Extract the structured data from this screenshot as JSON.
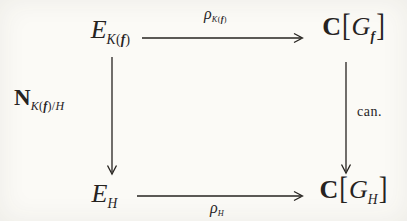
{
  "colors": {
    "ink": "#26231f",
    "paper": "#fbfaf6"
  },
  "diagram": {
    "nodes": {
      "tl": {
        "base": "E",
        "sub_k": "K",
        "sub_lp": "(",
        "sub_f": "f",
        "sub_rp": ")"
      },
      "tr": {
        "c": "C",
        "lb": "[",
        "g": "G",
        "sub_f": "f",
        "rb": "]"
      },
      "bl": {
        "base": "E",
        "sub_h": "H"
      },
      "br": {
        "c": "C",
        "lb": "[",
        "g": "G",
        "sub_h": "H",
        "rb": "]"
      }
    },
    "arrows": {
      "top": {
        "rho": "ρ",
        "sub_k": "K",
        "sub_lp": "(",
        "sub_f": "f",
        "sub_rp": ")"
      },
      "left": {
        "n": "N",
        "sub_k": "K",
        "sub_lp": "(",
        "sub_f": "f",
        "sub_rp": ")",
        "sub_slash": "/",
        "sub_h": "H"
      },
      "right": {
        "label": "can."
      },
      "bottom": {
        "rho": "ρ",
        "sub_h": "H"
      }
    }
  }
}
